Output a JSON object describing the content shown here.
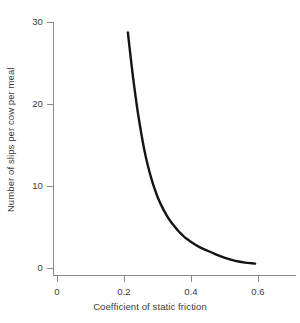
{
  "chart_data": {
    "type": "line",
    "title": "",
    "xlabel": "Coefficient of static friction",
    "ylabel": "Number of slips per cow per meal",
    "xlim": [
      0,
      0.724
    ],
    "ylim": [
      0,
      31
    ],
    "xticks": [
      0,
      0.2,
      0.4,
      0.6
    ],
    "xtick_labels": [
      "0",
      "0.2",
      "0.4",
      "0.6"
    ],
    "yticks": [
      0,
      10,
      20,
      30
    ],
    "ytick_labels": [
      "0",
      "10",
      "20",
      "30"
    ],
    "grid": false,
    "legend": null,
    "series": [
      {
        "name": "slips per cow per meal",
        "x": [
          0.21,
          0.215,
          0.22,
          0.225,
          0.23,
          0.24,
          0.25,
          0.26,
          0.27,
          0.28,
          0.29,
          0.3,
          0.31,
          0.32,
          0.33,
          0.34,
          0.35,
          0.36,
          0.37,
          0.38,
          0.39,
          0.4,
          0.42,
          0.44,
          0.46,
          0.48,
          0.5,
          0.52,
          0.54,
          0.56,
          0.58,
          0.59
        ],
        "y": [
          28.8,
          27.0,
          25.2,
          23.5,
          21.9,
          19.0,
          16.5,
          14.3,
          12.5,
          11.0,
          9.7,
          8.6,
          7.7,
          6.9,
          6.2,
          5.6,
          5.1,
          4.6,
          4.2,
          3.8,
          3.5,
          3.2,
          2.7,
          2.3,
          1.95,
          1.6,
          1.3,
          1.05,
          0.85,
          0.72,
          0.64,
          0.6
        ],
        "color": "#141414",
        "line_width": 2.4,
        "markers": false
      }
    ]
  },
  "axes": {
    "axis_color": "#8a8a8a",
    "tick_color": "#8a8a8a",
    "text_color": "#3a3a3a",
    "background": "#ffffff"
  }
}
